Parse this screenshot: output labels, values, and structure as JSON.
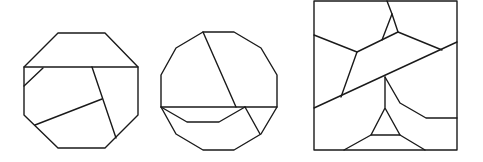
{
  "diagram": {
    "title": "",
    "stroke_color": "#1a1a1a",
    "background": "#ffffff",
    "figures": [
      {
        "name": "octagon-dissection",
        "outline": [
          [
            58,
            33
          ],
          [
            105,
            33
          ],
          [
            138,
            67
          ],
          [
            138,
            115
          ],
          [
            105,
            148
          ],
          [
            58,
            148
          ],
          [
            24,
            115
          ],
          [
            24,
            67
          ]
        ],
        "cuts": [
          [
            [
              24,
              67
            ],
            [
              138,
              67
            ]
          ],
          [
            [
              43,
              68
            ],
            [
              24,
              86
            ]
          ],
          [
            [
              92,
              67
            ],
            [
              116,
              138
            ]
          ],
          [
            [
              102,
              99
            ],
            [
              35,
              125
            ]
          ]
        ]
      },
      {
        "name": "dodecagon-dissection",
        "outline": [
          [
            203,
            32
          ],
          [
            234,
            32
          ],
          [
            261,
            48
          ],
          [
            277,
            75
          ],
          [
            277,
            107
          ],
          [
            261,
            134
          ],
          [
            234,
            150
          ],
          [
            203,
            150
          ],
          [
            176,
            134
          ],
          [
            161,
            107
          ],
          [
            161,
            75
          ],
          [
            176,
            48
          ]
        ],
        "cuts": [
          [
            [
              161,
              107
            ],
            [
              277,
              107
            ]
          ],
          [
            [
              203,
              32
            ],
            [
              236,
              107
            ]
          ],
          [
            [
              245,
              107
            ],
            [
              260,
              134
            ]
          ],
          [
            [
              161,
              107
            ],
            [
              187,
              122
            ],
            [
              219,
              122
            ],
            [
              245,
              107
            ]
          ]
        ]
      },
      {
        "name": "square-dissection",
        "outline": [
          [
            314,
            1
          ],
          [
            457,
            1
          ],
          [
            457,
            150
          ],
          [
            314,
            150
          ]
        ],
        "cuts": [
          [
            [
              314,
              108
            ],
            [
              457,
              42
            ]
          ],
          [
            [
              387,
              1
            ],
            [
              392,
              14
            ],
            [
              398,
              32
            ],
            [
              442,
              50
            ]
          ],
          [
            [
              392,
              14
            ],
            [
              382,
              40
            ]
          ],
          [
            [
              398,
              32
            ],
            [
              357,
              52
            ],
            [
              314,
              35
            ]
          ],
          [
            [
              357,
              52
            ],
            [
              341,
              97
            ]
          ],
          [
            [
              385,
              77
            ],
            [
              385,
              108
            ],
            [
              371,
              135
            ],
            [
              400,
              135
            ],
            [
              385,
              108
            ]
          ],
          [
            [
              385,
              77
            ],
            [
              400,
              103
            ],
            [
              426,
              118
            ],
            [
              457,
              118
            ]
          ],
          [
            [
              371,
              135
            ],
            [
              344,
              150
            ]
          ],
          [
            [
              400,
              135
            ],
            [
              425,
              150
            ]
          ]
        ]
      }
    ]
  }
}
